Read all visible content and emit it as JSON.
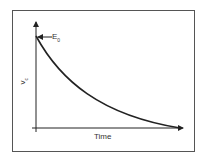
{
  "diagram": {
    "initial_label": {
      "main": "E",
      "sub": "0"
    },
    "y_axis_label": {
      "main": "v",
      "sub": "c"
    },
    "x_axis_label": "Time",
    "curve_type": "exponential-decay",
    "colors": {
      "line": "#222222",
      "frame": "#555555",
      "text": "#333333"
    }
  }
}
